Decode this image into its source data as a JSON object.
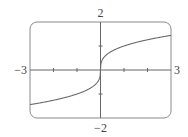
{
  "chart_data": {
    "type": "line",
    "title": "",
    "function": "y = x^(1/3)",
    "xlabel": "",
    "ylabel": "",
    "xlim": [
      -3,
      3
    ],
    "ylim": [
      -2,
      2
    ],
    "x_ticks": [
      -2,
      -1,
      1,
      2
    ],
    "y_ticks": [
      -1,
      1
    ],
    "tick_labels": {
      "xmin": "−3",
      "xmax": "3",
      "ymax": "2",
      "ymin": "−2"
    },
    "grid": false,
    "legend": null,
    "series": [
      {
        "name": "cube root",
        "x": [
          -3,
          -2,
          -1,
          -0.5,
          -0.125,
          -0.01,
          0,
          0.01,
          0.125,
          0.5,
          1,
          2,
          3
        ],
        "values": [
          -1.442,
          -1.26,
          -1,
          -0.794,
          -0.5,
          -0.215,
          0,
          0.215,
          0.5,
          0.794,
          1,
          1.26,
          1.442
        ]
      }
    ]
  },
  "labels": {
    "xmin": "−3",
    "xmax": "3",
    "ymax": "2",
    "ymin": "−2"
  },
  "colors": {
    "frame": "#8a8a8a",
    "axis": "#666666",
    "curve": "#6a6a6a",
    "text": "#444444"
  }
}
